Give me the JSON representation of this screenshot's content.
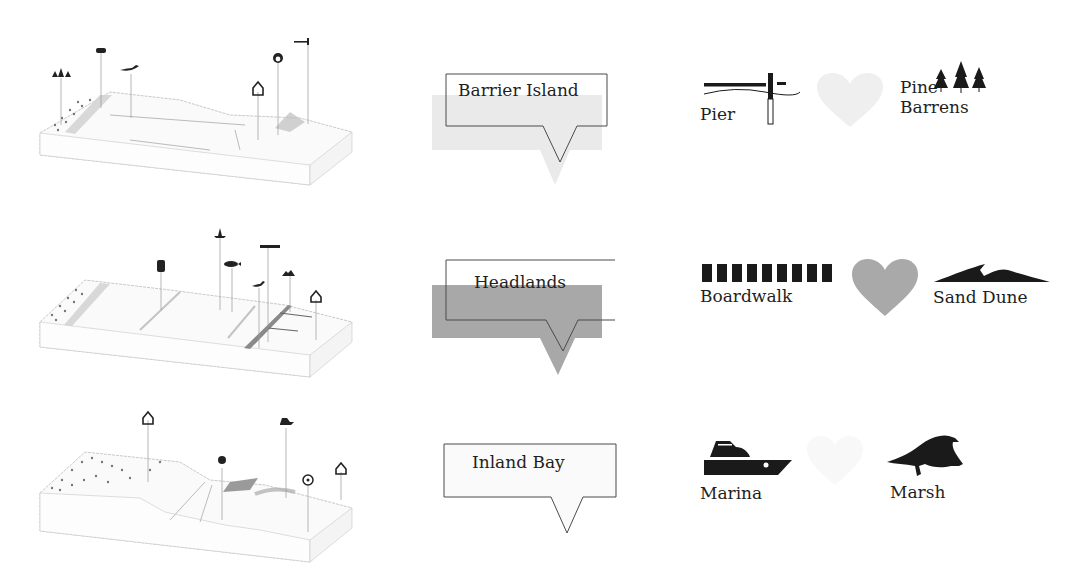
{
  "rows": [
    {
      "id": "barrier-island",
      "title": "Barrier Island",
      "bubble_fill": "#e6e6e6",
      "bubble_fill_opacity": 0.85,
      "legend": [
        {
          "label": "Pier",
          "icon": "pier-icon"
        },
        {
          "label": "",
          "icon": "heart-icon",
          "color": "#efefef"
        },
        {
          "label_line1": "Pine",
          "label_line2": "Barrens",
          "icon": "pine-trees-icon"
        }
      ],
      "landscape_markers": [
        "pine-trees-icon",
        "car-icon",
        "bird-icon",
        "house-icon",
        "target-icon",
        "pier-icon"
      ]
    },
    {
      "id": "headlands",
      "title": "Headlands",
      "bubble_fill": "#a8a8a8",
      "bubble_fill_opacity": 1,
      "legend": [
        {
          "label": "Boardwalk",
          "icon": "boardwalk-icon"
        },
        {
          "label": "",
          "icon": "heart-icon",
          "color": "#a9a9a9"
        },
        {
          "label": "Sand Dune",
          "icon": "sand-dune-icon"
        }
      ],
      "landscape_markers": [
        "train-icon",
        "lighthouse-icon",
        "fish-icon",
        "boardwalk-icon",
        "bird-icon",
        "sand-dune-icon",
        "building-icon"
      ]
    },
    {
      "id": "inland-bay",
      "title": "Inland Bay",
      "bubble_fill": "#f7f7f7",
      "bubble_fill_opacity": 0.6,
      "legend": [
        {
          "label": "Marina",
          "icon": "boat-icon"
        },
        {
          "label": "",
          "icon": "heart-icon",
          "color": "#f8f8f8"
        },
        {
          "label": "Marsh",
          "icon": "bird-icon"
        }
      ],
      "landscape_markers": [
        "house-icon",
        "grass-icon",
        "boat-icon",
        "biohazard-icon",
        "building-icon"
      ]
    }
  ]
}
